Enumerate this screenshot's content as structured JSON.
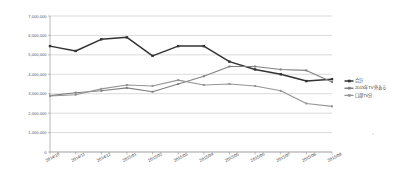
{
  "chart_data": {
    "type": "line",
    "title": "",
    "xlabel": "",
    "ylabel": "",
    "ylim": [
      0,
      7000000
    ],
    "ytick_step": 1000000,
    "grid": true,
    "legend_position": "right",
    "categories": [
      "2014/10",
      "2014/11",
      "2014/12",
      "2015/01",
      "2015/02",
      "2015/03",
      "2015/04",
      "2015/05",
      "2015/06",
      "2015/07",
      "2015/08",
      "2015/09"
    ],
    "ytick_labels": [
      "7,000,000",
      "6,000,000",
      "5,000,000",
      "4,000,000",
      "3,000,000",
      "2,000,000",
      "1,000,000",
      "0"
    ],
    "ytick_values": [
      7000000,
      6000000,
      5000000,
      4000000,
      3000000,
      2000000,
      1000000,
      0
    ],
    "series": [
      {
        "name": "合計",
        "color": "#333333",
        "values": [
          5450000,
          5200000,
          5800000,
          5900000,
          4950000,
          5450000,
          5450000,
          4650000,
          4250000,
          4000000,
          3650000,
          3750000
        ]
      },
      {
        "name": "2015年TV外ある",
        "color": "#808080",
        "values": [
          2900000,
          3050000,
          3150000,
          3300000,
          3100000,
          3500000,
          3900000,
          4400000,
          4400000,
          4250000,
          4200000,
          3600000
        ]
      },
      {
        "name": "口部TV分",
        "color": "#959595",
        "values": [
          2880000,
          2950000,
          3250000,
          3450000,
          3400000,
          3700000,
          3450000,
          3500000,
          3400000,
          3150000,
          2500000,
          2350000
        ]
      }
    ]
  }
}
